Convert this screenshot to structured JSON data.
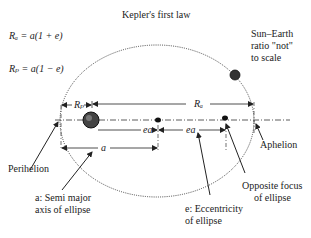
{
  "title": "Kepler's first law",
  "formulas": {
    "ra": "Rₐ = a(1 + e)",
    "rp": "Rₚ = a(1 − e)"
  },
  "note": {
    "line1": "Sun–Earth",
    "line2": "ratio \"not\"",
    "line3": "to scale"
  },
  "dimension_labels": {
    "rp": "Rₚ",
    "ra": "Rₐ",
    "ea1": "ea",
    "ea2": "ea",
    "a": "a"
  },
  "callouts": {
    "perihelion": "Perihelion",
    "aphelion": "Aphelion",
    "semi_major_1": "a: Semi major",
    "semi_major_2": "axis of ellipse",
    "eccentricity_1": "e: Eccentricity",
    "eccentricity_2": "of ellipse",
    "opposite_focus_1": "Opposite focus",
    "opposite_focus_2": "of ellipse"
  }
}
